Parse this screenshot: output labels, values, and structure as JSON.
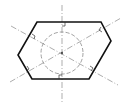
{
  "diagram": {
    "type": "technical-drawing",
    "colors": {
      "outline": "#111111",
      "centerline": "#8a8a8a",
      "circle": "#7a7a7a",
      "background": "#ffffff"
    },
    "hexagon": {
      "points": [
        [
          37,
          22
        ],
        [
          101,
          22
        ],
        [
          111,
          41
        ],
        [
          89,
          79
        ],
        [
          32,
          79
        ],
        [
          18,
          55
        ]
      ]
    },
    "circle": {
      "cx": 62,
      "cy": 53,
      "r": 21
    },
    "centerlines": [
      {
        "name": "vertical",
        "x1": 62,
        "y1": 5,
        "x2": 62,
        "y2": 103
      },
      {
        "name": "diagonal-a",
        "x1": 11,
        "y1": 26,
        "x2": 118,
        "y2": 85
      },
      {
        "name": "diagonal-b",
        "x1": 10,
        "y1": 82,
        "x2": 121,
        "y2": 18
      }
    ],
    "right_angle_marks": [
      {
        "x": 62,
        "y": 22,
        "dir": "down"
      },
      {
        "x": 59,
        "y": 79,
        "dir": "up"
      },
      {
        "x": 32,
        "y": 36,
        "dir": "edge"
      },
      {
        "x": 101,
        "y": 29,
        "dir": "edge"
      },
      {
        "x": 28,
        "y": 69,
        "dir": "edge"
      },
      {
        "x": 92,
        "y": 68,
        "dir": "edge"
      }
    ]
  }
}
